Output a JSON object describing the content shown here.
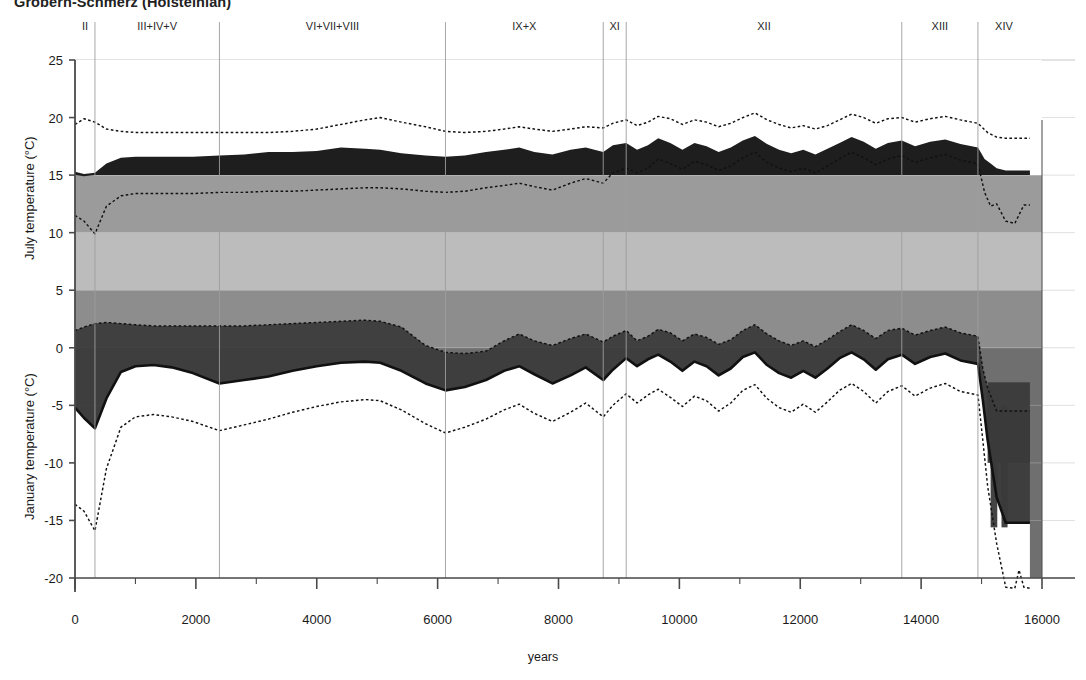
{
  "title": "Gröbern-Schmerz (Holsteinian)",
  "axes": {
    "y_label_top": "July temperature (°C)",
    "y_label_bottom": "January temperature (°C)",
    "x_label": "years",
    "y_ticks": [
      25,
      20,
      15,
      10,
      5,
      0,
      -5,
      -10,
      -15,
      -20
    ],
    "x_ticks": [
      0,
      2000,
      4000,
      6000,
      8000,
      10000,
      12000,
      14000,
      16000
    ],
    "x_minor_step": 1000
  },
  "zones": [
    {
      "label": "II",
      "start": 0,
      "end": 330
    },
    {
      "label": "III+IV+V",
      "start": 330,
      "end": 2390
    },
    {
      "label": "VI+VII+VIII",
      "start": 2390,
      "end": 6130
    },
    {
      "label": "IX+X",
      "start": 6130,
      "end": 8740
    },
    {
      "label": "XI",
      "start": 8740,
      "end": 9120
    },
    {
      "label": "XII",
      "start": 9120,
      "end": 13680
    },
    {
      "label": "XIII",
      "start": 13680,
      "end": 14940
    },
    {
      "label": "XIV",
      "start": 14940,
      "end": 15800
    }
  ],
  "colors": {
    "band_15_10": "#9b9b9b",
    "band_10_5": "#bcbcbc",
    "band_5_0": "#8d8d8d",
    "band_0_down": "#6f6f6f",
    "july_range_fill": "#1e1e1e",
    "january_range_fill": "#3a3a3a",
    "curve": "#111111",
    "grid": "#b9b9b9",
    "axis": "#4a4a4a"
  },
  "chart_data": {
    "type": "area",
    "title": "Gröbern-Schmerz (Holsteinian)",
    "xlabel": "years",
    "ylabel": "July temperature (°C) / January temperature (°C)",
    "xlim": [
      0,
      16000
    ],
    "ylim": [
      -22,
      25
    ],
    "grid": true,
    "legend": "none",
    "series": [
      {
        "name": "July maximum (dotted)",
        "x": [
          0,
          150,
          330,
          520,
          760,
          1000,
          1300,
          1600,
          1950,
          2390,
          2800,
          3200,
          3600,
          4000,
          4400,
          4800,
          5050,
          5400,
          5800,
          6130,
          6450,
          6800,
          7100,
          7350,
          7600,
          7900,
          8200,
          8450,
          8740,
          8900,
          9120,
          9300,
          9480,
          9650,
          9850,
          10050,
          10250,
          10450,
          10650,
          10850,
          11050,
          11250,
          11450,
          11650,
          11850,
          12050,
          12250,
          12450,
          12650,
          12850,
          13050,
          13250,
          13450,
          13680,
          13900,
          14150,
          14400,
          14650,
          14940,
          15100,
          15250,
          15400,
          15550,
          15700,
          15800
        ],
        "y": [
          19.4,
          19.9,
          19.6,
          19.0,
          18.8,
          18.7,
          18.7,
          18.7,
          18.7,
          18.7,
          18.7,
          18.7,
          18.8,
          19.0,
          19.4,
          19.8,
          20.0,
          19.6,
          19.2,
          18.8,
          18.7,
          18.8,
          19.0,
          19.2,
          19.0,
          18.8,
          19.0,
          19.2,
          19.1,
          19.5,
          19.8,
          19.3,
          19.6,
          20.1,
          19.9,
          19.4,
          19.8,
          19.6,
          19.2,
          19.5,
          20.0,
          20.4,
          19.8,
          19.4,
          19.1,
          19.3,
          19.0,
          19.3,
          19.8,
          20.3,
          20.0,
          19.5,
          19.9,
          20.0,
          19.6,
          19.9,
          20.1,
          19.8,
          19.5,
          18.7,
          18.3,
          18.2,
          18.2,
          18.2,
          18.2
        ]
      },
      {
        "name": "July most-probable upper bound (band top)",
        "x": [
          0,
          150,
          330,
          520,
          760,
          1000,
          1300,
          1600,
          1950,
          2390,
          2800,
          3200,
          3600,
          4000,
          4400,
          4800,
          5050,
          5400,
          5800,
          6130,
          6450,
          6800,
          7100,
          7350,
          7600,
          7900,
          8200,
          8450,
          8740,
          8900,
          9120,
          9300,
          9480,
          9650,
          9850,
          10050,
          10250,
          10450,
          10650,
          10850,
          11050,
          11250,
          11450,
          11650,
          11850,
          12050,
          12250,
          12450,
          12650,
          12850,
          13050,
          13250,
          13450,
          13680,
          13900,
          14150,
          14400,
          14650,
          14940,
          15050,
          15150,
          15250,
          15400,
          15550,
          15700,
          15800
        ],
        "y": [
          15.3,
          15.1,
          15.2,
          16.0,
          16.5,
          16.6,
          16.6,
          16.6,
          16.6,
          16.7,
          16.8,
          17.0,
          17.0,
          17.1,
          17.4,
          17.3,
          17.2,
          16.9,
          16.7,
          16.6,
          16.7,
          17.0,
          17.2,
          17.4,
          17.0,
          16.8,
          17.2,
          17.4,
          17.0,
          17.6,
          17.8,
          17.2,
          17.6,
          18.2,
          17.8,
          17.2,
          17.8,
          17.5,
          17.0,
          17.4,
          18.0,
          18.4,
          17.7,
          17.2,
          16.9,
          17.2,
          16.8,
          17.3,
          17.8,
          18.3,
          17.9,
          17.3,
          17.8,
          18.0,
          17.5,
          17.9,
          18.1,
          17.7,
          17.4,
          16.4,
          16.0,
          15.6,
          15.4,
          15.4,
          15.4,
          15.4
        ]
      },
      {
        "name": "July most-probable lower bound (band base)",
        "x": [
          0,
          150,
          330,
          520,
          760,
          1000,
          1300,
          1600,
          1950,
          2390,
          2800,
          3200,
          3600,
          4000,
          4400,
          4800,
          5050,
          5400,
          5800,
          6130,
          6450,
          6800,
          7100,
          7350,
          7600,
          7900,
          8200,
          8450,
          8740,
          8900,
          9120,
          9300,
          9480,
          9650,
          9850,
          10050,
          10250,
          10450,
          10650,
          10850,
          11050,
          11250,
          11450,
          11650,
          11850,
          12050,
          12250,
          12450,
          12650,
          12850,
          13050,
          13250,
          13450,
          13680,
          13900,
          14150,
          14400,
          14650,
          14940,
          15050,
          15150,
          15250,
          15400,
          15550,
          15700,
          15800
        ],
        "y": [
          15.0,
          14.9,
          15.0,
          15.0,
          15.0,
          15.0,
          15.0,
          15.0,
          15.0,
          15.0,
          15.0,
          15.0,
          15.0,
          15.0,
          15.0,
          15.0,
          15.0,
          15.0,
          15.0,
          15.0,
          15.0,
          15.0,
          15.0,
          15.0,
          15.0,
          15.0,
          15.0,
          15.0,
          15.0,
          15.0,
          15.0,
          15.0,
          15.0,
          15.0,
          15.0,
          15.0,
          15.0,
          15.0,
          15.0,
          15.0,
          15.0,
          15.0,
          15.0,
          15.0,
          15.0,
          15.0,
          15.0,
          15.0,
          15.0,
          15.0,
          15.0,
          15.0,
          15.0,
          15.0,
          15.0,
          15.0,
          15.0,
          15.0,
          15.0,
          15.0,
          15.0,
          15.0,
          15.0,
          15.0,
          15.0,
          15.0
        ]
      },
      {
        "name": "July minimum (dotted, inner)",
        "x": [
          0,
          150,
          330,
          520,
          760,
          1000,
          1300,
          1600,
          1950,
          2390,
          2800,
          3200,
          3600,
          4000,
          4400,
          4800,
          5050,
          5400,
          5800,
          6130,
          6450,
          6800,
          7100,
          7350,
          7600,
          7900,
          8200,
          8450,
          8740,
          8900,
          9120,
          9300,
          9480,
          9650,
          9850,
          10050,
          10250,
          10450,
          10650,
          10850,
          11050,
          11250,
          11450,
          11650,
          11850,
          12050,
          12250,
          12450,
          12650,
          12850,
          13050,
          13250,
          13450,
          13680,
          13900,
          14150,
          14400,
          14650,
          14940,
          15050,
          15150,
          15250,
          15400,
          15550,
          15700,
          15800
        ],
        "y": [
          11.5,
          11.0,
          9.9,
          12.3,
          13.2,
          13.4,
          13.4,
          13.4,
          13.4,
          13.5,
          13.5,
          13.6,
          13.6,
          13.7,
          13.8,
          13.9,
          13.9,
          13.8,
          13.6,
          13.5,
          13.6,
          13.9,
          14.1,
          14.3,
          14.0,
          13.7,
          14.3,
          14.7,
          14.3,
          15.2,
          15.6,
          15.2,
          15.6,
          16.4,
          16.0,
          15.5,
          16.2,
          15.9,
          15.4,
          15.8,
          16.5,
          17.0,
          16.1,
          15.6,
          15.3,
          15.6,
          15.2,
          15.8,
          16.4,
          17.0,
          16.5,
          15.9,
          16.4,
          16.7,
          16.1,
          16.5,
          16.8,
          16.3,
          16.0,
          13.5,
          12.3,
          12.5,
          11.0,
          10.8,
          12.4,
          12.4
        ]
      },
      {
        "name": "January maximum (dotted, upper)",
        "x": [
          0,
          150,
          330,
          520,
          760,
          1000,
          1300,
          1600,
          1950,
          2390,
          2800,
          3200,
          3600,
          4000,
          4400,
          4800,
          5050,
          5400,
          5800,
          6130,
          6450,
          6800,
          7100,
          7350,
          7600,
          7900,
          8200,
          8450,
          8740,
          8900,
          9120,
          9300,
          9480,
          9650,
          9850,
          10050,
          10250,
          10450,
          10650,
          10850,
          11050,
          11250,
          11450,
          11650,
          11850,
          12050,
          12250,
          12450,
          12650,
          12850,
          13050,
          13250,
          13450,
          13680,
          13900,
          14150,
          14400,
          14650,
          14940,
          15020,
          15100,
          15250,
          15400,
          15550,
          15700,
          15800
        ],
        "y": [
          1.5,
          1.8,
          2.1,
          2.2,
          2.1,
          2.0,
          1.9,
          1.9,
          1.9,
          1.9,
          1.9,
          2.0,
          2.1,
          2.2,
          2.3,
          2.4,
          2.3,
          1.8,
          0.2,
          -0.4,
          -0.5,
          -0.3,
          0.6,
          1.2,
          0.6,
          0.2,
          0.8,
          1.2,
          0.5,
          1.0,
          1.5,
          0.6,
          1.0,
          1.6,
          1.3,
          0.6,
          1.2,
          0.9,
          0.3,
          0.7,
          1.5,
          2.0,
          1.2,
          0.6,
          0.2,
          0.6,
          0.1,
          0.7,
          1.4,
          2.0,
          1.5,
          0.8,
          1.5,
          1.7,
          1.1,
          1.5,
          1.8,
          1.3,
          1.0,
          -1.8,
          -3.5,
          -5.5,
          -5.5,
          -5.5,
          -5.5,
          -5.5
        ]
      },
      {
        "name": "January most-probable upper bound (solid dark line)",
        "x": [
          0,
          150,
          330,
          520,
          760,
          1000,
          1300,
          1600,
          1950,
          2390,
          2800,
          3200,
          3600,
          4000,
          4400,
          4800,
          5050,
          5400,
          5800,
          6130,
          6450,
          6800,
          7100,
          7350,
          7600,
          7900,
          8200,
          8450,
          8740,
          8900,
          9120,
          9300,
          9480,
          9650,
          9850,
          10050,
          10250,
          10450,
          10650,
          10850,
          11050,
          11250,
          11450,
          11650,
          11850,
          12050,
          12250,
          12450,
          12650,
          12850,
          13050,
          13250,
          13450,
          13680,
          13900,
          14150,
          14400,
          14650,
          14940,
          15020,
          15100,
          15250,
          15400,
          15550,
          15700,
          15800
        ],
        "y": [
          -5.2,
          -6.1,
          -7.0,
          -4.4,
          -2.1,
          -1.6,
          -1.5,
          -1.7,
          -2.2,
          -3.1,
          -2.8,
          -2.5,
          -2.0,
          -1.6,
          -1.3,
          -1.2,
          -1.3,
          -2.0,
          -3.1,
          -3.7,
          -3.4,
          -2.8,
          -2.0,
          -1.6,
          -2.3,
          -3.1,
          -2.4,
          -1.7,
          -2.8,
          -1.9,
          -0.9,
          -1.6,
          -1.0,
          -0.6,
          -1.2,
          -2.0,
          -1.2,
          -1.6,
          -2.4,
          -1.8,
          -0.8,
          -0.4,
          -1.5,
          -2.2,
          -2.6,
          -2.0,
          -2.6,
          -1.8,
          -0.9,
          -0.4,
          -1.0,
          -1.9,
          -1.0,
          -0.6,
          -1.4,
          -0.8,
          -0.5,
          -1.1,
          -1.4,
          -4.5,
          -8.0,
          -13.0,
          -15.2,
          -15.2,
          -15.2,
          -15.2
        ]
      },
      {
        "name": "January minimum (dotted, lower)",
        "x": [
          0,
          150,
          330,
          520,
          760,
          1000,
          1300,
          1600,
          1950,
          2390,
          2800,
          3200,
          3600,
          4000,
          4400,
          4800,
          5050,
          5400,
          5800,
          6130,
          6450,
          6800,
          7100,
          7350,
          7600,
          7900,
          8200,
          8450,
          8740,
          8900,
          9120,
          9300,
          9480,
          9650,
          9850,
          10050,
          10250,
          10450,
          10650,
          10850,
          11050,
          11250,
          11450,
          11650,
          11850,
          12050,
          12250,
          12450,
          12650,
          12850,
          13050,
          13250,
          13450,
          13680,
          13900,
          14150,
          14400,
          14650,
          14940,
          15020,
          15100,
          15250,
          15400,
          15550,
          15620,
          15700,
          15800
        ],
        "y": [
          -13.6,
          -14.2,
          -15.9,
          -10.5,
          -6.9,
          -6.0,
          -5.8,
          -6.0,
          -6.4,
          -7.2,
          -6.7,
          -6.2,
          -5.6,
          -5.1,
          -4.7,
          -4.5,
          -4.6,
          -5.4,
          -6.6,
          -7.4,
          -6.9,
          -6.2,
          -5.4,
          -4.9,
          -5.7,
          -6.4,
          -5.6,
          -4.8,
          -6.0,
          -5.0,
          -4.0,
          -4.8,
          -4.1,
          -3.6,
          -4.3,
          -5.1,
          -4.2,
          -4.6,
          -5.5,
          -4.8,
          -3.7,
          -3.2,
          -4.4,
          -5.2,
          -5.6,
          -4.9,
          -5.6,
          -4.7,
          -3.7,
          -3.1,
          -3.8,
          -4.8,
          -3.8,
          -3.3,
          -4.2,
          -3.5,
          -3.1,
          -3.8,
          -4.1,
          -8.0,
          -12.0,
          -17.0,
          -20.8,
          -20.9,
          -19.3,
          -20.8,
          -20.9
        ]
      }
    ],
    "reference_bands": [
      {
        "from": 15,
        "to": 10,
        "color": "#9b9b9b"
      },
      {
        "from": 10,
        "to": 5,
        "color": "#bcbcbc"
      },
      {
        "from": 5,
        "to": 0,
        "color": "#8d8d8d"
      },
      {
        "from": 0,
        "to": -22,
        "color": "#6f6f6f"
      }
    ]
  }
}
